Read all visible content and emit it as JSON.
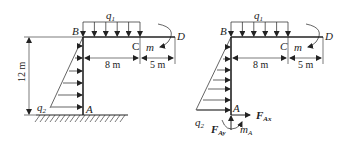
{
  "figure": {
    "left_panel": {
      "name": "loaded-frame",
      "points": {
        "B": "B",
        "C": "C",
        "D": "D",
        "A": "A"
      },
      "loads": {
        "distributed_top": "q",
        "distributed_top_sub": "1",
        "distributed_left": "q",
        "distributed_left_sub": "2",
        "moment": "m"
      },
      "dimensions": {
        "bc": "8 m",
        "cd": "5 m",
        "height": "12 m"
      },
      "support": "fixed"
    },
    "right_panel": {
      "name": "free-body-diagram",
      "points": {
        "B": "B",
        "C": "C",
        "D": "D",
        "A": "A"
      },
      "loads": {
        "distributed_top": "q",
        "distributed_top_sub": "1",
        "distributed_left": "q",
        "distributed_left_sub": "2",
        "moment": "m"
      },
      "dimensions": {
        "bc": "8 m",
        "cd": "5 m"
      },
      "reactions": {
        "fax": "F",
        "fax_sub": "Ax",
        "fay": "F",
        "fay_sub": "Ay",
        "ma": "m",
        "ma_sub": "A"
      }
    }
  }
}
